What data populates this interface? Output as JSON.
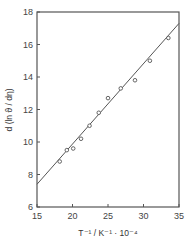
{
  "chart_data": {
    "type": "scatter",
    "title": "",
    "xlabel": "T⁻¹ / K⁻¹ · 10⁻⁴",
    "ylabel": "d (ln ϑ / dη)",
    "xlim": [
      15,
      35
    ],
    "ylim": [
      6,
      18
    ],
    "xticks": [
      15,
      20,
      25,
      30,
      35
    ],
    "yticks": [
      6,
      8,
      10,
      12,
      14,
      16,
      18
    ],
    "grid": false,
    "legend": null,
    "series": [
      {
        "name": "data",
        "marker": "open-circle",
        "x": [
          18.2,
          19.2,
          20.1,
          21.2,
          22.4,
          23.7,
          25.0,
          26.8,
          28.8,
          30.9,
          33.5
        ],
        "y": [
          8.8,
          9.5,
          9.6,
          10.2,
          11.0,
          11.8,
          12.7,
          13.3,
          13.8,
          15.0,
          16.4
        ]
      },
      {
        "name": "linear fit",
        "style": "line",
        "x": [
          15,
          35
        ],
        "y": [
          7.4,
          17.3
        ]
      }
    ]
  },
  "colors": {
    "axis": "#555555",
    "line": "#555555",
    "marker": "#555555",
    "text": "#333333"
  }
}
